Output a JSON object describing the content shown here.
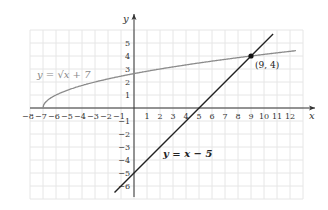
{
  "chart_data": {
    "type": "line",
    "title": "",
    "xlabel": "x",
    "ylabel": "y",
    "xlim": [
      -8,
      12
    ],
    "ylim": [
      -7,
      6
    ],
    "grid": true,
    "x_ticks": [
      -8,
      -7,
      -6,
      -5,
      -4,
      -3,
      -2,
      -1,
      1,
      2,
      3,
      4,
      5,
      6,
      7,
      8,
      9,
      10,
      11,
      12
    ],
    "y_ticks": [
      -6,
      -5,
      -4,
      -3,
      -2,
      -1,
      1,
      2,
      3,
      4,
      5
    ],
    "series": [
      {
        "name": "y = √(x + 7)",
        "function": "sqrt(x+7)",
        "domain": [
          -7,
          12
        ],
        "color": "#888888",
        "label_text": "y = √x + 7"
      },
      {
        "name": "y = x − 5",
        "function": "x-5",
        "domain": [
          -1.5,
          10.7
        ],
        "color": "#222222",
        "label_text": "y = x − 5"
      }
    ],
    "annotations": [
      {
        "text": "(9, 4)",
        "x": 9,
        "y": 4,
        "marker": "point"
      }
    ]
  },
  "labels": {
    "x_axis": "x",
    "y_axis": "y",
    "sqrt_label": "y = √x + 7",
    "line_label": "y = x − 5",
    "intersection": "(9, 4)"
  }
}
